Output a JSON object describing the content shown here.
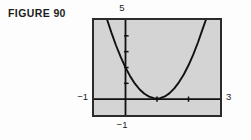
{
  "figure": {
    "label": "FIGURE 90"
  },
  "colors": {
    "screen_fill": "#d4d4d4",
    "frame_border": "#2b2b2b",
    "axis": "#111111",
    "curve": "#111111",
    "page_background": "#fdfdfd",
    "text": "#1c1c1c"
  },
  "axis_labels": {
    "y_max": "5",
    "y_min": "−1",
    "x_min": "−1",
    "x_max": "3"
  },
  "chart_data": {
    "type": "line",
    "title": "FIGURE 90",
    "xlabel": "",
    "ylabel": "",
    "xlim": [
      -1,
      3
    ],
    "ylim": [
      -1,
      5
    ],
    "grid": false,
    "legend": null,
    "axis_tick_marks": {
      "x_ticks": [
        1,
        2
      ],
      "y_ticks": [
        1,
        2,
        3,
        4
      ]
    },
    "annotations": [
      "Graphing-calculator viewport showing an upward-opening parabola",
      "Viewport window: x from -1 to 3, y from -1 to 5",
      "Vertex located near x = 1, y = 0.3",
      "Both branches exit through the top edge of the viewport"
    ],
    "series": [
      {
        "name": "parabola",
        "x": [
          -0.58,
          -0.45,
          -0.3,
          -0.15,
          0.0,
          0.15,
          0.3,
          0.45,
          0.6,
          0.75,
          0.9,
          1.0,
          1.1,
          1.25,
          1.4,
          1.55,
          1.7,
          1.85,
          2.0,
          2.15,
          2.3,
          2.45,
          2.55
        ],
        "y": [
          5.0,
          4.22,
          3.39,
          2.65,
          2.0,
          1.44,
          0.98,
          0.61,
          0.34,
          0.16,
          0.06,
          0.04,
          0.06,
          0.17,
          0.38,
          0.68,
          1.08,
          1.56,
          2.14,
          2.81,
          3.58,
          4.44,
          5.0
        ]
      }
    ]
  }
}
